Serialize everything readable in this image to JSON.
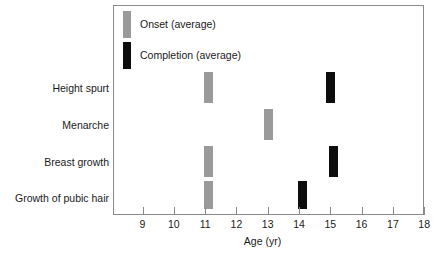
{
  "chart_data": {
    "type": "bar",
    "title": "",
    "subtitle": "",
    "xlabel": "Age (yr)",
    "ylabel": "",
    "xlim": [
      8.4,
      18.0
    ],
    "xticks": [
      9,
      10,
      11,
      12,
      13,
      14,
      15,
      16,
      17,
      18
    ],
    "xtick_labels": [
      "9",
      "10",
      "11",
      "12",
      "13",
      "14",
      "15",
      "16",
      "17",
      "18"
    ],
    "grid": false,
    "legend_position": "top-left",
    "categories": [
      "Height spurt",
      "Menarche",
      "Breast growth",
      "Growth of pubic hair"
    ],
    "series": [
      {
        "name": "Onset (average)",
        "color": "#9a9a9a",
        "values": [
          11.1,
          13.0,
          11.1,
          11.1
        ]
      },
      {
        "name": "Completion (average)",
        "color": "#0d0d0d",
        "values": [
          15.0,
          null,
          15.1,
          14.1
        ]
      }
    ],
    "marks": [
      {
        "category": "Height spurt",
        "series": "Onset (average)",
        "age": 11.1,
        "color": "#9a9a9a"
      },
      {
        "category": "Height spurt",
        "series": "Completion (average)",
        "age": 15.0,
        "color": "#0d0d0d"
      },
      {
        "category": "Menarche",
        "series": "Onset (average)",
        "age": 13.0,
        "color": "#9a9a9a"
      },
      {
        "category": "Breast growth",
        "series": "Onset (average)",
        "age": 11.1,
        "color": "#9a9a9a"
      },
      {
        "category": "Breast growth",
        "series": "Completion (average)",
        "age": 15.1,
        "color": "#0d0d0d"
      },
      {
        "category": "Growth of pubic hair",
        "series": "Onset (average)",
        "age": 11.1,
        "color": "#9a9a9a"
      },
      {
        "category": "Growth of pubic hair",
        "series": "Completion (average)",
        "age": 14.1,
        "color": "#0d0d0d"
      }
    ]
  },
  "legend": {
    "items": [
      {
        "label": "Onset (average)",
        "swatch": "gray"
      },
      {
        "label": "Completion (average)",
        "swatch": "black"
      }
    ]
  },
  "axis": {
    "title": "Age (yr)",
    "ticks": [
      "9",
      "10",
      "11",
      "12",
      "13",
      "14",
      "15",
      "16",
      "17",
      "18"
    ]
  },
  "categories": [
    {
      "label": "Height spurt"
    },
    {
      "label": "Menarche"
    },
    {
      "label": "Breast growth"
    },
    {
      "label": "Growth of pubic hair"
    }
  ]
}
